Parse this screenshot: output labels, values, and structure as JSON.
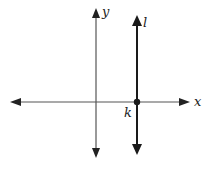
{
  "diagram": {
    "type": "coordinate-plane",
    "labels": {
      "y_axis": "y",
      "x_axis": "x",
      "line": "l",
      "point": "k"
    },
    "colors": {
      "axis": "#555555",
      "line": "#1a1a1a",
      "point": "#1a1a1a"
    }
  }
}
